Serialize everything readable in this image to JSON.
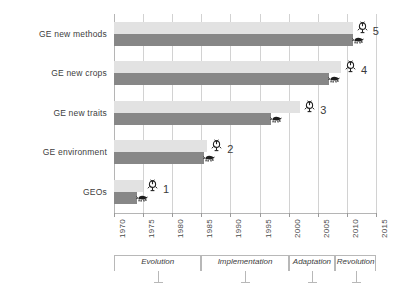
{
  "chart_data": {
    "type": "bar",
    "orientation": "horizontal",
    "title": "",
    "xlabel": "",
    "ylabel": "",
    "xlim": [
      1970,
      2015
    ],
    "xticks": [
      "1970",
      "1975",
      "1980",
      "1985",
      "1990",
      "1995",
      "2000",
      "2005",
      "2010",
      "2015"
    ],
    "grid": true,
    "legend": "none",
    "categories": [
      "GEOs",
      "GE environment",
      "GE new traits",
      "GE new crops",
      "GE new methods"
    ],
    "category_numbers": [
      "1",
      "2",
      "3",
      "4",
      "5"
    ],
    "series": [
      {
        "name": "plants",
        "icon": "plant-icon",
        "color": "#e2e2e2",
        "values": [
          1975,
          1986,
          2002,
          2009,
          2011
        ]
      },
      {
        "name": "animals",
        "icon": "animal-icon",
        "color": "#878787",
        "values": [
          1974,
          1985.5,
          1997,
          2007,
          2011
        ]
      }
    ],
    "eras": [
      {
        "label": "Evolution",
        "start": 1970,
        "end": 1985
      },
      {
        "label": "Implementation",
        "start": 1985,
        "end": 2000
      },
      {
        "label": "Adaptation",
        "start": 2000,
        "end": 2008
      },
      {
        "label": "Revolution",
        "start": 2008,
        "end": 2015
      }
    ]
  },
  "colors": {
    "bar_light": "#e2e2e2",
    "bar_dark": "#878787",
    "grid": "#d2d2d2",
    "axis": "#b5b5b5",
    "text": "#3a3a3a"
  }
}
